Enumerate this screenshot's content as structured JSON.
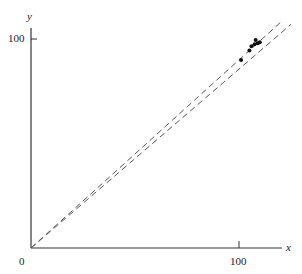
{
  "chart_data": {
    "type": "scatter",
    "title": "",
    "xlabel": "x",
    "ylabel": "y",
    "xlim": [
      0,
      110
    ],
    "ylim": [
      0,
      110
    ],
    "x_ticks": [
      "0",
      "100"
    ],
    "y_ticks": [
      "100"
    ],
    "grid": false,
    "legend": null,
    "series": [
      {
        "name": "points",
        "type": "scatter",
        "x": [
          101,
          105,
          106,
          107.5,
          108,
          109,
          110
        ],
        "y": [
          90,
          94.5,
          96.5,
          97.5,
          99.5,
          98,
          98.5
        ]
      },
      {
        "name": "dashed line 1",
        "type": "line",
        "style": "dashed",
        "x": [
          0,
          120
        ],
        "y": [
          0,
          108
        ]
      },
      {
        "name": "dashed line 2",
        "type": "line",
        "style": "dashed",
        "x": [
          0,
          125
        ],
        "y": [
          0,
          107
        ]
      }
    ]
  },
  "labels": {
    "origin": "0",
    "x_tick": "100",
    "y_tick": "100",
    "x_axis": "x",
    "y_axis": "y"
  }
}
